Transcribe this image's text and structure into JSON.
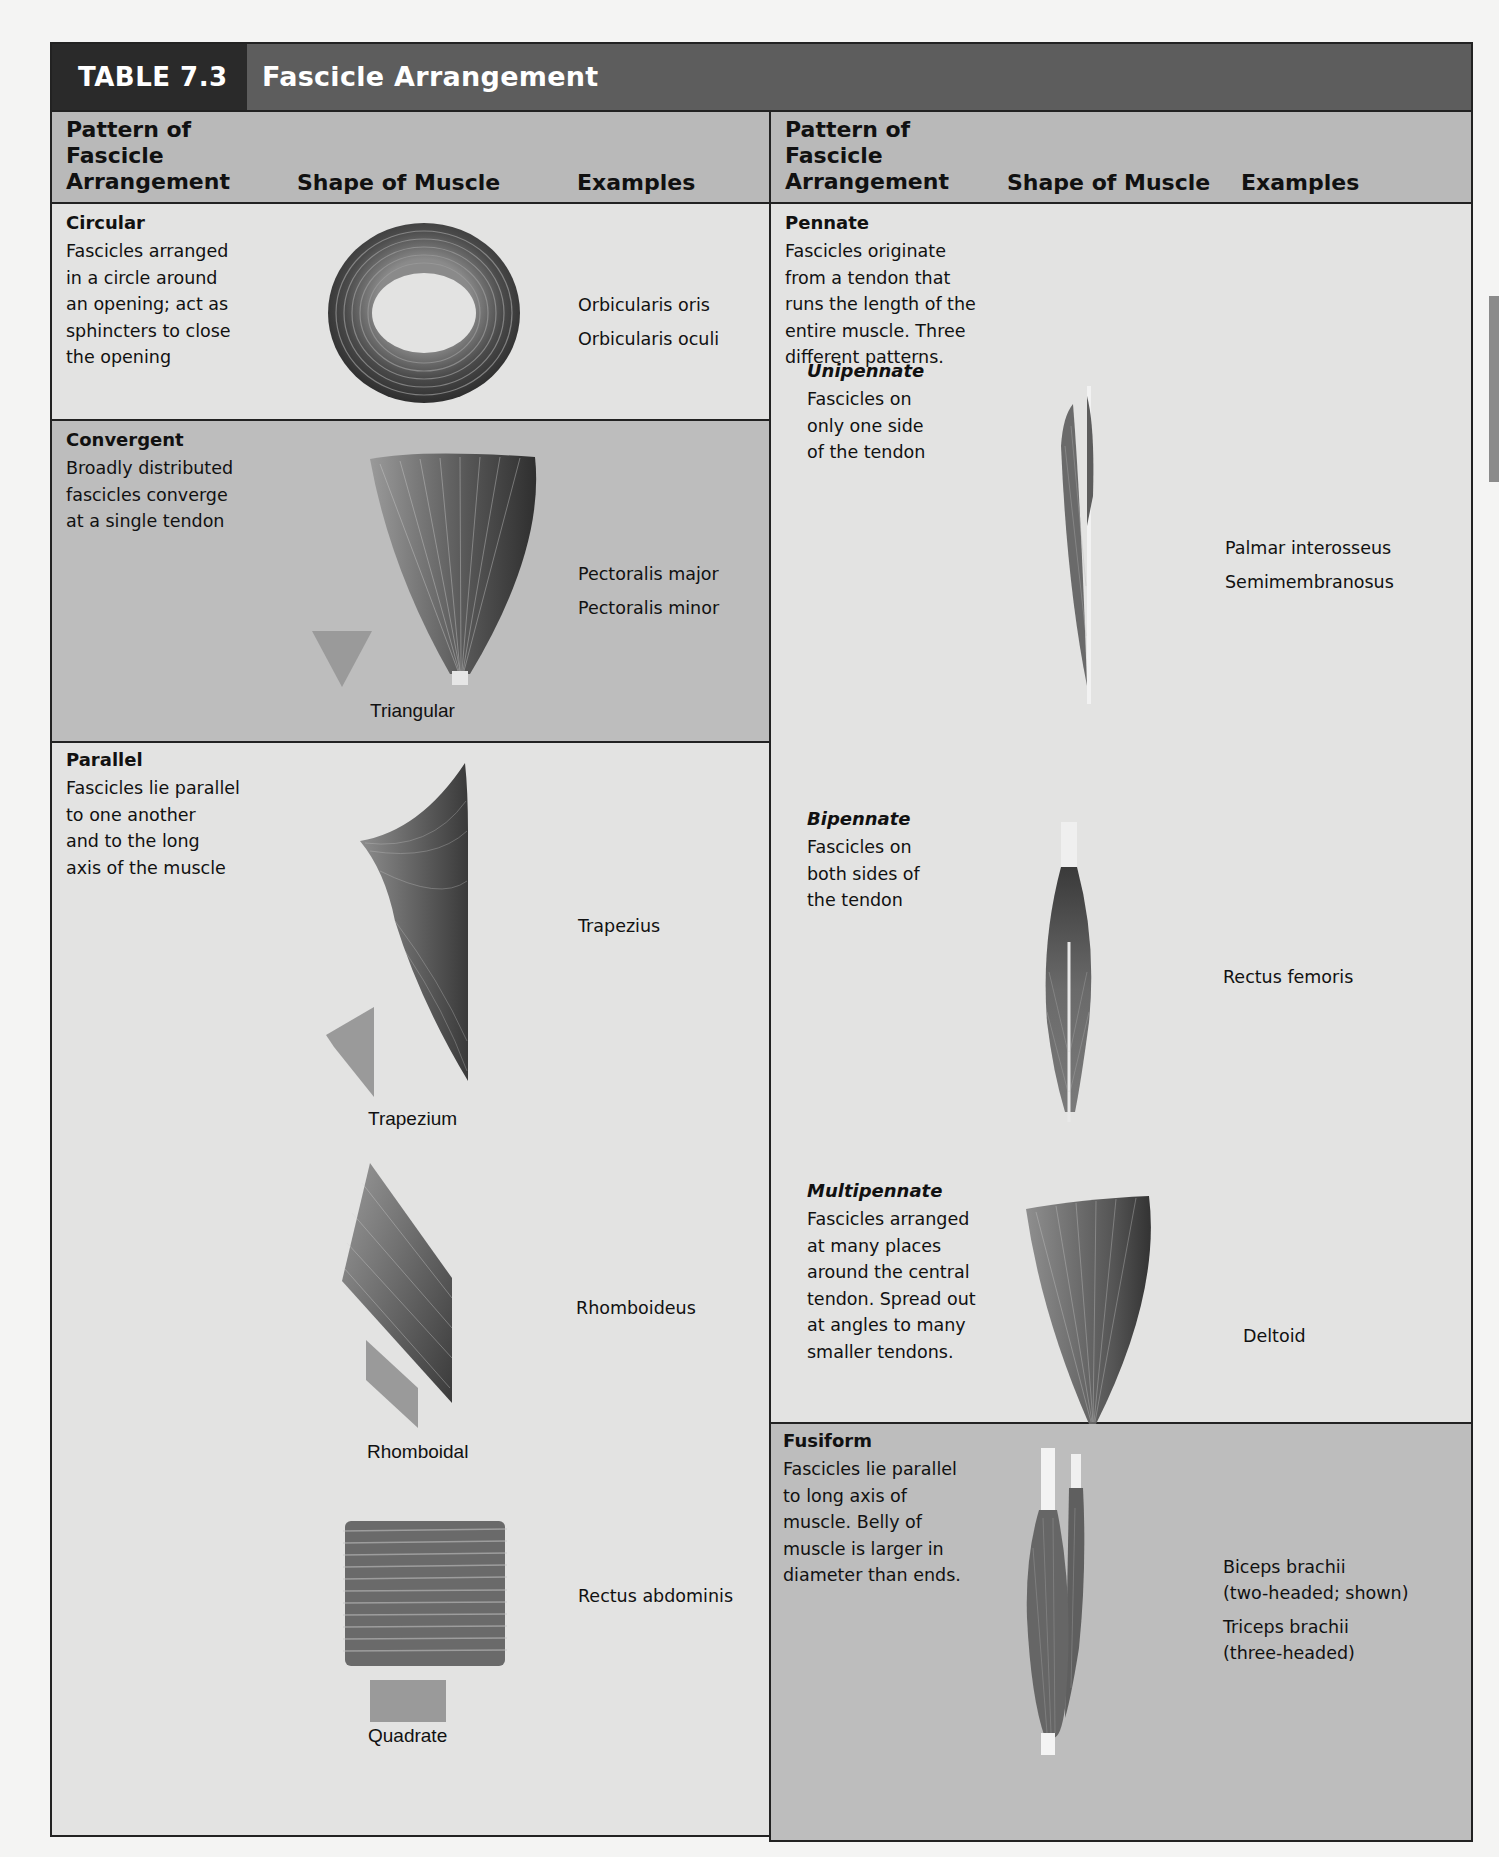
{
  "table": {
    "number": "TABLE 7.3",
    "title": "Fascicle Arrangement"
  },
  "headers": {
    "pattern": "Pattern of\nFascicle\nArrangement",
    "shape": "Shape of Muscle",
    "examples": "Examples"
  },
  "left_column": {
    "circular": {
      "title": "Circular",
      "description": "Fascicles arranged\nin a circle around\nan opening; act as\nsphincters to close\nthe opening",
      "examples": [
        "Orbicularis oris",
        "Orbicularis oculi"
      ],
      "shape_icon": "ring-muscle-icon"
    },
    "convergent": {
      "title": "Convergent",
      "description": "Broadly distributed\nfascicles converge\nat a single tendon",
      "examples": [
        "Pectoralis major",
        "Pectoralis minor"
      ],
      "shape_label": "Triangular",
      "shape_icon": "triangle-icon"
    },
    "parallel": {
      "title": "Parallel",
      "description": "Fascicles lie parallel\nto one another\nand to the long\naxis of the muscle",
      "items": [
        {
          "example": "Trapezius",
          "shape_label": "Trapezium",
          "shape_icon": "trapezium-icon"
        },
        {
          "example": "Rhomboideus",
          "shape_label": "Rhomboidal",
          "shape_icon": "rhomboid-icon"
        },
        {
          "example": "Rectus abdominis",
          "shape_label": "Quadrate",
          "shape_icon": "square-icon"
        }
      ]
    }
  },
  "right_column": {
    "pennate": {
      "title": "Pennate",
      "description": "Fascicles originate\nfrom a tendon that\nruns the length of the\nentire muscle. Three\ndifferent patterns.",
      "unipennate": {
        "title": "Unipennate",
        "description": "Fascicles on\nonly one side\nof the tendon",
        "examples": [
          "Palmar interosseus",
          "Semimembranosus"
        ]
      },
      "bipennate": {
        "title": "Bipennate",
        "description": "Fascicles on\nboth sides of\nthe tendon",
        "examples": [
          "Rectus femoris"
        ]
      },
      "multipennate": {
        "title": "Multipennate",
        "description": "Fascicles arranged\nat many places\naround the central\ntendon. Spread out\nat angles to many\nsmaller tendons.",
        "examples": [
          "Deltoid"
        ]
      }
    },
    "fusiform": {
      "title": "Fusiform",
      "description": "Fascicles lie parallel\nto long axis of\nmuscle. Belly of\nmuscle is larger in\ndiameter than ends.",
      "examples": [
        "Biceps brachii\n(two-headed; shown)",
        "Triceps brachii\n(three-headed)"
      ]
    }
  },
  "colors": {
    "title_dark": "#2a2a2a",
    "title_bar": "#5d5d5d",
    "header_bg": "#b9b9b9",
    "row_light": "#e3e3e2",
    "row_dark": "#bdbdbd",
    "shape_swatch": "#9a9a9a",
    "muscle": "#5a5a5a"
  }
}
